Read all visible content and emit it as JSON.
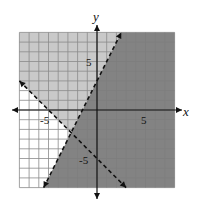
{
  "chart_data": {
    "type": "inequality-graph",
    "title": "",
    "xlabel": "x",
    "ylabel": "y",
    "xlim": [
      -8,
      8
    ],
    "ylim": [
      -8,
      8
    ],
    "grid": true,
    "grid_step": 1,
    "tick_labels": {
      "x": [
        {
          "value": -5,
          "label": "-5"
        },
        {
          "value": 5,
          "label": "5"
        }
      ],
      "y": [
        {
          "value": 5,
          "label": "5"
        },
        {
          "value": -5,
          "label": "-5"
        }
      ]
    },
    "boundary_lines": [
      {
        "equation": "y = 2x + 3",
        "slope": 2,
        "intercept": 3,
        "style": "dashed",
        "endpoints": [
          [
            -5.5,
            -8
          ],
          [
            2.5,
            8
          ]
        ]
      },
      {
        "equation": "y = -x - 5",
        "slope": -1,
        "intercept": -5,
        "style": "dashed",
        "endpoints": [
          [
            -8,
            3
          ],
          [
            3,
            -8
          ]
        ]
      }
    ],
    "intersection": [
      -2.67,
      -2.33
    ],
    "shaded_regions": [
      {
        "description": "y < 2x + 3 (right of steep line)",
        "shade": "dark"
      },
      {
        "description": "y > -x - 5 and y > 2x + 3",
        "shade": "light"
      },
      {
        "description": "y < -x - 5 and y > 2x + 3",
        "shade": "none"
      }
    ]
  },
  "colors": {
    "dark_shade": "#7c7c7c",
    "light_shade": "#c9c9c9",
    "grid": "#8a8a8a",
    "axis": "#111111",
    "line": "#111111"
  },
  "labels": {
    "x_axis": "x",
    "y_axis": "y",
    "x_pos5": "5",
    "x_neg5": "-5",
    "y_pos5": "5",
    "y_neg5": "-5"
  }
}
